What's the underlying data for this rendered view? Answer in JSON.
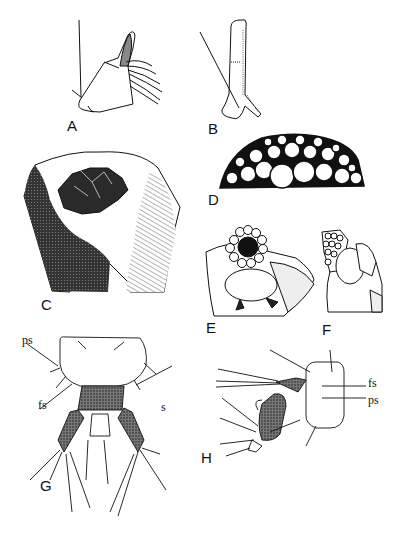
{
  "figure": {
    "panels": [
      {
        "id": "A",
        "label": "A",
        "description": "Mouthpart appendage with distal setal brush"
      },
      {
        "id": "B",
        "label": "B",
        "description": "Elongate appendage with long seta"
      },
      {
        "id": "C",
        "label": "C",
        "description": "Shaded body segment with central sclerotized structure"
      },
      {
        "id": "D",
        "label": "D",
        "description": "Dome of rounded pebble-like cells"
      },
      {
        "id": "E",
        "label": "E",
        "description": "Ring of cells surrounding dark opening"
      },
      {
        "id": "F",
        "label": "F",
        "description": "Lateral view of cellular structure"
      },
      {
        "id": "G",
        "label": "G",
        "description": "Terminal segment with stippled appendages, dorsal view"
      },
      {
        "id": "H",
        "label": "H",
        "description": "Terminal segment with appendage, lateral view"
      }
    ],
    "annotations": {
      "G": {
        "ps": "ps",
        "fs": "fs",
        "s": "s"
      },
      "H": {
        "fs": "fs",
        "ps": "ps"
      }
    },
    "colors": {
      "ink": "#111111",
      "stipple": "#555555",
      "paper": "#ffffff"
    }
  }
}
